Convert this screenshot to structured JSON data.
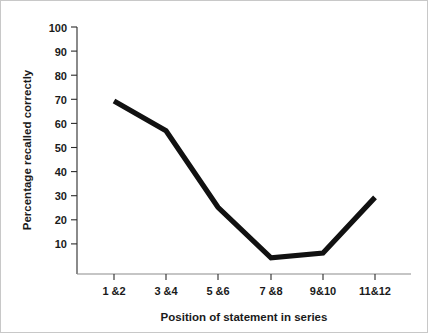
{
  "chart_data": {
    "type": "line",
    "title": "",
    "xlabel": "Position of statement in series",
    "ylabel": "Percentage recalled correctly",
    "categories": [
      "1 &2",
      "3 &4",
      "5 &6",
      "7 &8",
      "9&10",
      "11&12"
    ],
    "values": [
      70,
      58,
      27,
      6.5,
      8.5,
      31
    ],
    "series": [
      {
        "name": "Percentage recalled correctly",
        "values": [
          70,
          58,
          27,
          6.5,
          8.5,
          31
        ]
      }
    ],
    "ylim": [
      0,
      100
    ],
    "ytick_labels": [
      "10",
      "20",
      "30",
      "40",
      "50",
      "60",
      "70",
      "80",
      "90",
      "100"
    ],
    "ytick_values": [
      10,
      20,
      30,
      40,
      50,
      60,
      70,
      80,
      90,
      100
    ],
    "grid": "off",
    "legend": "none",
    "line_color": "#111111",
    "axis_color": "#2b2b2b",
    "background_color": "#ffffff"
  }
}
